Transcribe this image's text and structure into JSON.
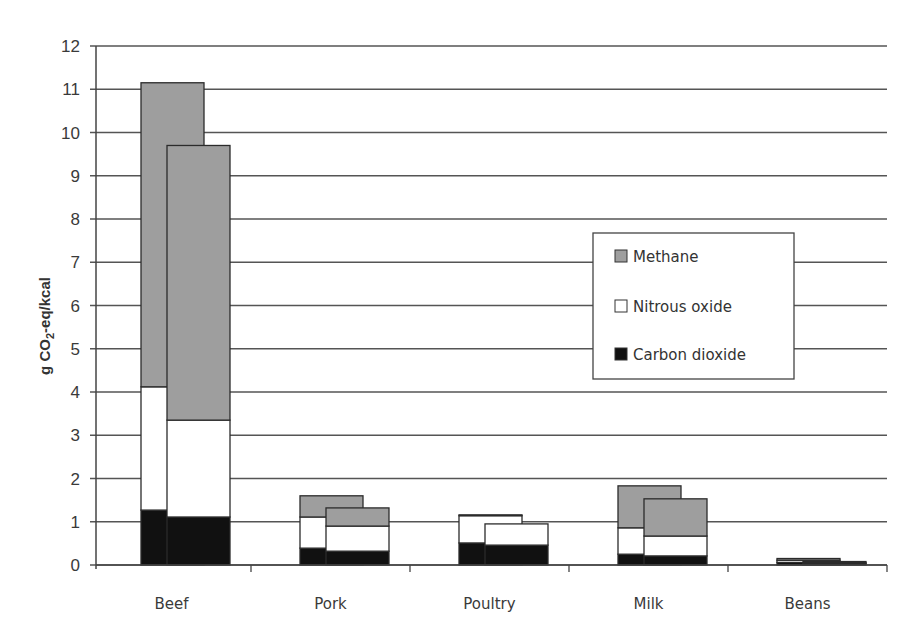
{
  "chart_data": {
    "type": "bar",
    "stacked": true,
    "title": "",
    "xlabel": "",
    "ylabel": "g CO2-eq/kcal",
    "ylabel_parts": {
      "pre": "g CO",
      "sub": "2",
      "post": "-eq/kcal"
    },
    "ylim": [
      0,
      12
    ],
    "yticks": [
      0,
      1,
      2,
      3,
      4,
      5,
      6,
      7,
      8,
      9,
      10,
      11,
      12
    ],
    "grid": true,
    "legend_position": "inside-right",
    "categories": [
      "Beef",
      "Pork",
      "Poultry",
      "Milk",
      "Beans"
    ],
    "bars_per_category": 2,
    "series": [
      {
        "name": "Carbon dioxide",
        "color": "#111111",
        "values": [
          [
            1.27,
            1.11
          ],
          [
            0.39,
            0.32
          ],
          [
            0.51,
            0.46
          ],
          [
            0.25,
            0.21
          ],
          [
            0.06,
            0.04
          ]
        ]
      },
      {
        "name": "Nitrous oxide",
        "color": "#ffffff",
        "values": [
          [
            2.85,
            2.24
          ],
          [
            0.72,
            0.58
          ],
          [
            0.63,
            0.49
          ],
          [
            0.61,
            0.46
          ],
          [
            0.05,
            0.01
          ]
        ]
      },
      {
        "name": "Methane",
        "color": "#9e9e9e",
        "values": [
          [
            7.03,
            6.35
          ],
          [
            0.49,
            0.42
          ],
          [
            0.02,
            0.0
          ],
          [
            0.97,
            0.86
          ],
          [
            0.04,
            0.03
          ]
        ]
      }
    ],
    "totals": [
      [
        11.15,
        9.7
      ],
      [
        1.6,
        1.32
      ],
      [
        1.16,
        0.95
      ],
      [
        1.83,
        1.53
      ],
      [
        0.15,
        0.08
      ]
    ]
  },
  "legend": {
    "items": [
      {
        "label": "Methane",
        "color": "#9e9e9e"
      },
      {
        "label": "Nitrous oxide",
        "color": "#ffffff"
      },
      {
        "label": "Carbon dioxide",
        "color": "#111111"
      }
    ]
  }
}
